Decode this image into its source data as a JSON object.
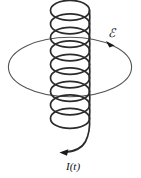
{
  "figure": {
    "kind": "physics-diagram",
    "background_color": "#ffffff",
    "width": 141,
    "height": 178
  },
  "labels": {
    "emf": {
      "text": "ℰ",
      "name": "emf-label",
      "meaning": "electromotive force"
    },
    "current": {
      "text": "I(t)",
      "name": "current-label",
      "meaning": "time varying current"
    }
  },
  "colors": {
    "coil_stroke": "#2b2b2b",
    "loop_stroke": "#555555",
    "arrow_fill": "#1a1a1a",
    "background": "#ffffff"
  },
  "geometry": {
    "helix": {
      "turns": 8,
      "center_x": 70,
      "top_y": 6,
      "bottom_y": 146,
      "radius_x": 19.5,
      "radius_y": 9.0,
      "turn_pitch": 17.5
    },
    "loop": {
      "center_x": 70,
      "center_y": 67,
      "radius_x": 62,
      "radius_y": 30
    },
    "lead_arrow": {
      "tip_x": 61,
      "tip_y": 152,
      "direction": "left"
    },
    "loop_arrow": {
      "tip_x": 113,
      "tip_y": 45,
      "direction": "down-right"
    }
  },
  "elements": [
    {
      "name": "solenoid-helix",
      "role": "coil of wire carrying current"
    },
    {
      "name": "induction-loop",
      "role": "large circular conducting loop"
    },
    {
      "name": "loop-direction-arrow",
      "role": "direction of induced emf"
    },
    {
      "name": "current-lead-arrow",
      "role": "direction of current in lead wire"
    }
  ]
}
